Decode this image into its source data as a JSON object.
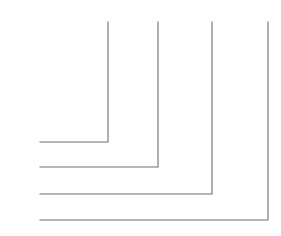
{
  "diagram": {
    "background_color": "#ffffff",
    "wire_color": "#6e6e6e",
    "symbol_color": "#111111",
    "width": 281,
    "height": 236
  },
  "pins": [
    {
      "id": "D0",
      "label": "D0",
      "marker": "≪",
      "role": "row",
      "index": 0,
      "y": 32
    },
    {
      "id": "D1",
      "label": "D1",
      "marker": "≪",
      "role": "row",
      "index": 1,
      "y": 58
    },
    {
      "id": "D2",
      "label": "D2",
      "marker": "≪",
      "role": "row",
      "index": 2,
      "y": 85
    },
    {
      "id": "D3",
      "label": "D3",
      "marker": "≪",
      "role": "row",
      "index": 3,
      "y": 112
    },
    {
      "id": "D4",
      "label": "D4",
      "marker": "≪",
      "role": "column",
      "index": 0,
      "y": 142
    },
    {
      "id": "D5",
      "label": "D5",
      "marker": "≪",
      "role": "column",
      "index": 1,
      "y": 167
    },
    {
      "id": "D6",
      "label": "D6",
      "marker": "≪",
      "role": "column",
      "index": 2,
      "y": 194
    },
    {
      "id": "D7",
      "label": "D7",
      "marker": "≪",
      "role": "column",
      "index": 3,
      "y": 220
    }
  ],
  "rows": [
    {
      "pin": "D0",
      "keys": [
        "1",
        "2",
        "3",
        "A"
      ]
    },
    {
      "pin": "D1",
      "keys": [
        "4",
        "5",
        "6",
        "B"
      ]
    },
    {
      "pin": "D2",
      "keys": [
        "7",
        "8",
        "9",
        "C"
      ]
    },
    {
      "pin": "D3",
      "keys": [
        "*",
        "0",
        "#",
        "D"
      ]
    }
  ],
  "columns": [
    {
      "pin": "D4",
      "keys": [
        "1",
        "4",
        "7",
        "*"
      ],
      "x": 108
    },
    {
      "pin": "D5",
      "keys": [
        "2",
        "5",
        "8",
        "0"
      ],
      "x": 158
    },
    {
      "pin": "D6",
      "keys": [
        "3",
        "6",
        "9",
        "#"
      ],
      "x": 212
    },
    {
      "pin": "D7",
      "keys": [
        "A",
        "B",
        "C",
        "D"
      ],
      "x": 268
    }
  ],
  "keys": [
    {
      "label": "1",
      "row": "D0",
      "column": "D4",
      "symbol": "push-button-switch"
    },
    {
      "label": "2",
      "row": "D0",
      "column": "D5",
      "symbol": "push-button-switch"
    },
    {
      "label": "3",
      "row": "D0",
      "column": "D6",
      "symbol": "push-button-switch"
    },
    {
      "label": "A",
      "row": "D0",
      "column": "D7",
      "symbol": "push-button-switch"
    },
    {
      "label": "4",
      "row": "D1",
      "column": "D4",
      "symbol": "push-button-switch"
    },
    {
      "label": "5",
      "row": "D1",
      "column": "D5",
      "symbol": "push-button-switch"
    },
    {
      "label": "6",
      "row": "D1",
      "column": "D6",
      "symbol": "push-button-switch"
    },
    {
      "label": "B",
      "row": "D1",
      "column": "D7",
      "symbol": "push-button-switch"
    },
    {
      "label": "7",
      "row": "D2",
      "column": "D4",
      "symbol": "push-button-switch"
    },
    {
      "label": "8",
      "row": "D2",
      "column": "D5",
      "symbol": "push-button-switch"
    },
    {
      "label": "9",
      "row": "D2",
      "column": "D6",
      "symbol": "push-button-switch"
    },
    {
      "label": "C",
      "row": "D2",
      "column": "D7",
      "symbol": "push-button-switch"
    },
    {
      "label": "*",
      "row": "D3",
      "column": "D4",
      "symbol": "push-button-switch"
    },
    {
      "label": "0",
      "row": "D3",
      "column": "D5",
      "symbol": "push-button-switch"
    },
    {
      "label": "#",
      "row": "D3",
      "column": "D6",
      "symbol": "push-button-switch"
    },
    {
      "label": "D",
      "row": "D3",
      "column": "D7",
      "symbol": "push-button-switch"
    }
  ]
}
